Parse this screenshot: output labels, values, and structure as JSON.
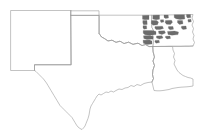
{
  "figure": {
    "type": "choropleth-map",
    "title": "",
    "background_color": "#ffffff",
    "border_color": "#9a9a9a",
    "shaded_color": "#6b6b6b",
    "unshaded_color": "#ffffff",
    "region_description": "South Central United States"
  },
  "map_data": {
    "type": "map",
    "projection": "geographic",
    "states": [
      {
        "name": "New Mexico",
        "abbr": "NM",
        "label": "",
        "shaded_count": 0
      },
      {
        "name": "Oklahoma",
        "abbr": "OK",
        "label": "",
        "shaded_count": 0
      },
      {
        "name": "Texas",
        "abbr": "TX",
        "label": "",
        "shaded_count": 0
      },
      {
        "name": "Arkansas",
        "abbr": "AR",
        "label": "",
        "shaded_count": 23
      },
      {
        "name": "Louisiana",
        "abbr": "LA",
        "label": "",
        "shaded_count": 0
      }
    ],
    "legend": {
      "visible": false,
      "entries": []
    },
    "annotations": []
  }
}
